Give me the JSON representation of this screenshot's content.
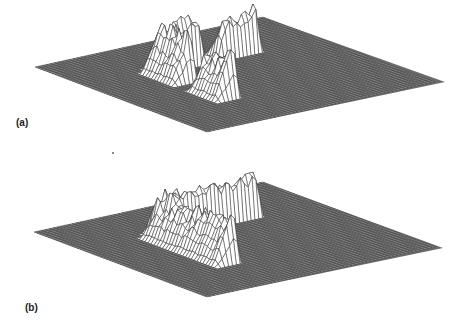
{
  "figure": {
    "panels": [
      {
        "id": "a",
        "label": "(a)"
      },
      {
        "id": "b",
        "label": "(b)"
      }
    ]
  },
  "chart_data": [
    {
      "type": "surface",
      "title": "",
      "panel_label": "(a)",
      "description": "3D wireframe surface on a square grid: flat base with two separated ridge arms forming an L-shaped rim (gap at the inner corner)",
      "grid_size": 60,
      "base_level": 0,
      "zlim": [
        0,
        1
      ],
      "features": [
        {
          "kind": "ridge",
          "axis": "x",
          "from": 0.28,
          "to": 0.5,
          "at": 0.33,
          "height": 0.75,
          "peak_height": 1.0,
          "peak_at": 0.3
        },
        {
          "kind": "ridge",
          "axis": "y",
          "from": 0.28,
          "to": 0.5,
          "at": 0.33,
          "height": 0.75,
          "peak_height": 1.0,
          "peak_at": 0.3
        },
        {
          "kind": "ridge",
          "axis": "x",
          "from": 0.55,
          "to": 0.75,
          "at": 0.33,
          "height": 0.65,
          "peak_height": 0.9,
          "peak_at": 0.72
        },
        {
          "kind": "ridge",
          "axis": "y",
          "from": 0.55,
          "to": 0.75,
          "at": 0.33,
          "height": 0.7,
          "peak_height": 0.9,
          "peak_at": 0.72
        }
      ],
      "connected": false
    },
    {
      "type": "surface",
      "title": "",
      "panel_label": "(b)",
      "description": "3D wireframe surface on a square grid: flat base with a continuous L-shaped ridge rim joined at the inner corner",
      "grid_size": 60,
      "base_level": 0,
      "zlim": [
        0,
        1
      ],
      "features": [
        {
          "kind": "ridge",
          "axis": "x",
          "from": 0.28,
          "to": 0.75,
          "at": 0.33,
          "height": 0.7,
          "peak_height": 1.0,
          "peak_at": 0.3
        },
        {
          "kind": "ridge",
          "axis": "y",
          "from": 0.28,
          "to": 0.75,
          "at": 0.33,
          "height": 0.7,
          "peak_height": 0.9,
          "peak_at": 0.72
        }
      ],
      "connected": true
    }
  ]
}
